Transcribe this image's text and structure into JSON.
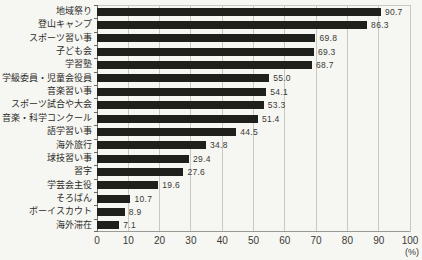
{
  "chart_data": {
    "type": "bar",
    "orientation": "horizontal",
    "title": "",
    "xlabel": "(%)",
    "ylabel": "",
    "categories": [
      "地域祭り",
      "登山キャンプ",
      "スポーツ習い事",
      "子ども会",
      "学習塾",
      "学級委員・児童会役員",
      "音楽習い事",
      "スポーツ試合や大会",
      "音楽・科学コンクール",
      "語学習い事",
      "海外旅行",
      "球技習い事",
      "習字",
      "学芸会主役",
      "そろばん",
      "ボーイスカウト",
      "海外滞在"
    ],
    "values": [
      90.7,
      86.3,
      69.8,
      69.3,
      68.7,
      55.0,
      54.1,
      53.3,
      51.4,
      44.5,
      34.8,
      29.4,
      27.6,
      19.6,
      10.7,
      8.9,
      7.1
    ],
    "xlim": [
      0,
      100
    ],
    "x_ticks": [
      0,
      10,
      20,
      30,
      40,
      50,
      60,
      70,
      80,
      90,
      100
    ],
    "x_unit_label": "(%)",
    "grid": true,
    "legend": "none",
    "colors": {
      "bar": "#1f1f1c",
      "background": "#f6f6f3",
      "gridline": "#c9c9c4",
      "axis": "#6b6b66",
      "text": "#2c2c28"
    }
  }
}
